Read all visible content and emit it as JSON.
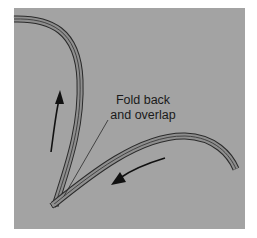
{
  "diagram": {
    "type": "technical illustration",
    "annotation": {
      "line1": "Fold back",
      "line2": "and overlap"
    },
    "arrows": [
      {
        "name": "upward-motion-arrow",
        "direction": "up"
      },
      {
        "name": "down-left-motion-arrow",
        "direction": "down-left"
      }
    ],
    "colors": {
      "background": "#a3a3a3",
      "strip_fill": "#8e8e8e",
      "strip_outline": "#2a2a2a",
      "arrow": "#111111",
      "text": "#1a1a1a"
    }
  }
}
